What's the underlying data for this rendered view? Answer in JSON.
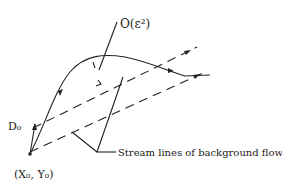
{
  "diagram": {
    "labels": {
      "order_term": "O(ε²)",
      "d0": "D₀",
      "origin": "(X₀, Y₀)",
      "streamlines": "Stream lines of background flow"
    },
    "colors": {
      "ink": "#222222",
      "background": "#ffffff"
    }
  }
}
